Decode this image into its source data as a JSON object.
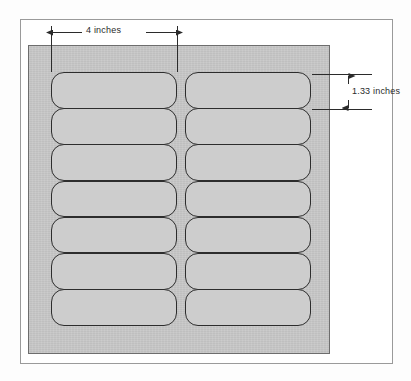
{
  "diagram": {
    "sheet": {
      "name": "label-sheet",
      "fill_color": "#c7c7c7",
      "border_color": "#6d6d6d",
      "columns": 2,
      "rows": 7,
      "total_labels": 14
    },
    "label": {
      "fill_color": "#cdcdcd",
      "border_color": "#2d2d2d",
      "corner_radius_px": 13
    },
    "dimensions": [
      {
        "id": "width",
        "text": "4 inches",
        "orientation": "horizontal",
        "measures": "label-width",
        "value": 4,
        "unit": "inches"
      },
      {
        "id": "height",
        "text": "1.33 inches",
        "orientation": "vertical",
        "measures": "label-height",
        "value": 1.33,
        "unit": "inches"
      }
    ],
    "colors": {
      "page_background": "#ffffff",
      "frame_border": "#9a9a9a",
      "annotation_line": "#2b2b2b"
    }
  }
}
